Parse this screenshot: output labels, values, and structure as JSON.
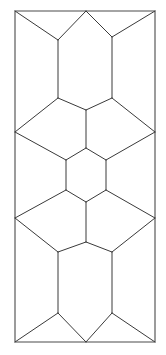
{
  "figure": {
    "kind": "geometric-tiling-diagram",
    "canvas": {
      "width": 166,
      "height": 355,
      "background": "#ffffff"
    },
    "stroke_color": "#3a3a3a",
    "border_color": "#4a4a4a",
    "fill_color": "#ffffff",
    "stroke_width": 1,
    "panel": {
      "name": "outer-rectangle",
      "x": 15,
      "y": 11,
      "width": 140,
      "height": 331,
      "points": "15,11 155,11 155,342 15,342"
    },
    "vertices": {
      "top_left": [
        15,
        11
      ],
      "top_mid": [
        86,
        11
      ],
      "top_right": [
        155,
        11
      ],
      "upper_left_junction": [
        58,
        40
      ],
      "upper_right_junction": [
        112,
        37
      ],
      "upper_hex_left_low": [
        58,
        98
      ],
      "upper_hex_right_low": [
        112,
        98
      ],
      "upper_hex_bottom_apex": [
        86,
        110
      ],
      "diamond1_left": [
        15,
        132
      ],
      "diamond1_right": [
        155,
        132
      ],
      "center_hex_top_apex": [
        86,
        148
      ],
      "center_hex_left_top": [
        66,
        160
      ],
      "center_hex_right_top": [
        106,
        160
      ],
      "center_hex_left_bottom": [
        66,
        190
      ],
      "center_hex_right_bottom": [
        106,
        190
      ],
      "center_hex_bottom_apex": [
        86,
        202
      ],
      "diamond2_left": [
        15,
        218
      ],
      "diamond2_right": [
        155,
        218
      ],
      "lower_left_junction": [
        58,
        252
      ],
      "lower_right_junction": [
        112,
        252
      ],
      "lower_hex_left_low": [
        58,
        313
      ],
      "lower_hex_right_low": [
        112,
        313
      ],
      "bottom_mid": [
        86,
        342
      ],
      "bottom_left": [
        15,
        342
      ],
      "bottom_right": [
        155,
        342
      ]
    },
    "tiles": [
      {
        "name": "top-left-triangle",
        "shape": "triangle",
        "points": "15,11 86,11 58,40"
      },
      {
        "name": "top-right-triangle",
        "shape": "triangle",
        "points": "86,11 155,11 112,37"
      },
      {
        "name": "upper-left-quad",
        "shape": "quadrilateral",
        "points": "15,11 58,40 58,98 15,132"
      },
      {
        "name": "upper-right-quad",
        "shape": "quadrilateral",
        "points": "155,11 155,132 112,98 112,37"
      },
      {
        "name": "upper-hexagon",
        "shape": "hexagon",
        "points": "86,11 112,37 112,98 86,110 58,98 58,40"
      },
      {
        "name": "upper-left-rhombus",
        "shape": "quadrilateral",
        "points": "15,132 58,98 86,110 86,148 66,160"
      },
      {
        "name": "upper-right-rhombus",
        "shape": "quadrilateral",
        "points": "155,132 106,160 86,148 86,110 112,98"
      },
      {
        "name": "center-hexagon",
        "shape": "hexagon",
        "points": "86,148 106,160 106,190 86,202 66,190 66,160"
      },
      {
        "name": "lower-left-rhombus",
        "shape": "quadrilateral",
        "points": "15,218 66,190 86,202 86,242 58,252"
      },
      {
        "name": "lower-right-rhombus",
        "shape": "quadrilateral",
        "points": "155,218 112,252 86,242 86,202 106,190"
      },
      {
        "name": "lower-hexagon",
        "shape": "hexagon",
        "points": "86,242 112,252 112,313 86,342 58,313 58,252"
      },
      {
        "name": "lower-left-quad",
        "shape": "quadrilateral",
        "points": "15,218 58,252 58,313 15,342"
      },
      {
        "name": "lower-right-quad",
        "shape": "quadrilateral",
        "points": "155,218 155,342 112,313 112,252"
      },
      {
        "name": "bottom-left-triangle",
        "shape": "triangle",
        "points": "15,342 58,313 86,342"
      },
      {
        "name": "bottom-right-triangle",
        "shape": "triangle",
        "points": "86,342 112,313 155,342"
      }
    ],
    "edges": [
      {
        "name": "edge-top-left-diagonal",
        "d": "M15,11 L58,40"
      },
      {
        "name": "edge-top-apex-left",
        "d": "M86,11 L58,40"
      },
      {
        "name": "edge-top-apex-right",
        "d": "M86,11 L112,37"
      },
      {
        "name": "edge-top-right-diagonal",
        "d": "M155,11 L112,37"
      },
      {
        "name": "edge-upper-hex-left-side",
        "d": "M58,40 L58,98"
      },
      {
        "name": "edge-upper-hex-right-side",
        "d": "M112,37 L112,98"
      },
      {
        "name": "edge-upper-hex-bottom-left",
        "d": "M58,98 L86,110"
      },
      {
        "name": "edge-upper-hex-bottom-right",
        "d": "M112,98 L86,110"
      },
      {
        "name": "edge-diamond1-upper-left",
        "d": "M15,132 L58,98"
      },
      {
        "name": "edge-diamond1-upper-right",
        "d": "M155,132 L112,98"
      },
      {
        "name": "edge-diamond1-lower-left",
        "d": "M15,132 L66,160"
      },
      {
        "name": "edge-diamond1-lower-right",
        "d": "M155,132 L106,160"
      },
      {
        "name": "edge-center-apex-left",
        "d": "M86,110 L86,148"
      },
      {
        "name": "edge-center-hex-top-left",
        "d": "M86,148 L66,160"
      },
      {
        "name": "edge-center-hex-top-right",
        "d": "M86,148 L106,160"
      },
      {
        "name": "edge-center-hex-left-side",
        "d": "M66,160 L66,190"
      },
      {
        "name": "edge-center-hex-right-side",
        "d": "M106,160 L106,190"
      },
      {
        "name": "edge-center-hex-bottom-left",
        "d": "M66,190 L86,202"
      },
      {
        "name": "edge-center-hex-bottom-right",
        "d": "M106,190 L86,202"
      },
      {
        "name": "edge-center-apex-down",
        "d": "M86,202 L86,242"
      },
      {
        "name": "edge-diamond2-upper-left",
        "d": "M15,218 L66,190"
      },
      {
        "name": "edge-diamond2-upper-right",
        "d": "M155,218 L106,190"
      },
      {
        "name": "edge-diamond2-lower-left",
        "d": "M15,218 L58,252"
      },
      {
        "name": "edge-diamond2-lower-right",
        "d": "M155,218 L112,252"
      },
      {
        "name": "edge-lower-hex-top-left",
        "d": "M86,242 L58,252"
      },
      {
        "name": "edge-lower-hex-top-right",
        "d": "M86,242 L112,252"
      },
      {
        "name": "edge-lower-hex-left-side",
        "d": "M58,252 L58,313"
      },
      {
        "name": "edge-lower-hex-right-side",
        "d": "M112,252 L112,313"
      },
      {
        "name": "edge-bottom-left-diagonal",
        "d": "M15,342 L58,313"
      },
      {
        "name": "edge-bottom-apex-left",
        "d": "M58,313 L86,342"
      },
      {
        "name": "edge-bottom-apex-right",
        "d": "M112,313 L86,342"
      },
      {
        "name": "edge-bottom-right-diagonal",
        "d": "M155,342 L112,313"
      }
    ]
  }
}
